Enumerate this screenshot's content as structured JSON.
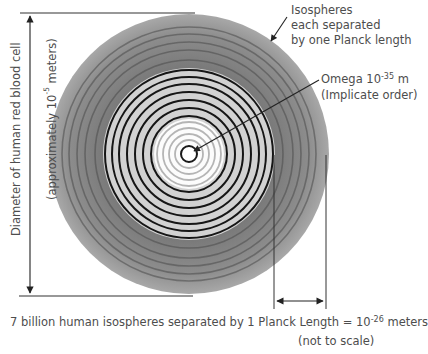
{
  "diagram": {
    "labels": {
      "isospheres": [
        "Isospheres",
        "each separated",
        "by one Planck length"
      ],
      "omega_prefix": "Omega 10",
      "omega_exp": "-35",
      "omega_unit": " m",
      "omega_note": "(Implicate order)",
      "diameter": "Diameter of human red blood cell",
      "approx_prefix": "(approximately 10",
      "approx_exp": "-5",
      "approx_suffix": " meters)",
      "bottom_prefix": "7 billion human isospheres separated by 1 Planck Length =  10",
      "bottom_exp": "-26",
      "bottom_suffix": " meters",
      "scale_note": "(not to scale)"
    },
    "geometry": {
      "center": [
        189,
        154
      ],
      "outer_radius": 140,
      "gray_band_inner_radius": 86,
      "light_zone_inner_radius": 34,
      "outer_dark_ring_radii": [
        94,
        104,
        112,
        120,
        127
      ],
      "black_ring_radii": [
        38,
        46,
        54,
        62,
        70,
        78,
        84
      ],
      "gray_ring_radii": [
        14,
        20,
        26,
        32
      ],
      "center_ring_radius": 8
    },
    "colors": {
      "outer_band": "#8a8a8a",
      "light_zone": "#d4d4d4",
      "interior": "#ffffff",
      "black_rings": "#1a1a1a",
      "gray_rings": "#b8b8b8",
      "lines": "#333333",
      "text": "#4d4d4d"
    }
  }
}
